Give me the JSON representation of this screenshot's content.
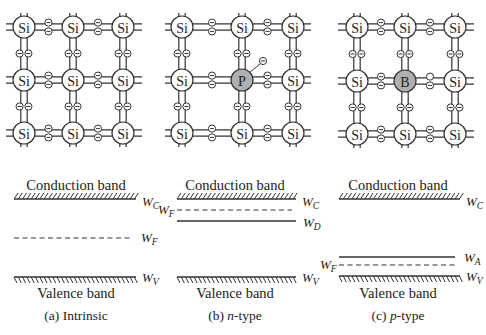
{
  "panels": [
    {
      "id": "a",
      "caption": "(a) Intrinsic",
      "dopant": null,
      "lattice_atoms": [
        [
          "Si",
          "Si",
          "Si"
        ],
        [
          "Si",
          "Si",
          "Si"
        ],
        [
          "Si",
          "Si",
          "Si"
        ]
      ],
      "conduction_label": "Conduction band",
      "valence_label": "Valence band",
      "levels": [
        {
          "name": "W",
          "sub": "C",
          "kind": "conduction"
        },
        {
          "name": "W",
          "sub": "F",
          "kind": "fermi-dashed"
        },
        {
          "name": "W",
          "sub": "V",
          "kind": "valence"
        }
      ]
    },
    {
      "id": "b",
      "caption_prefix": "(b) ",
      "caption_italic": "n",
      "caption_suffix": "-type",
      "dopant": "P",
      "free_electron": true,
      "lattice_atoms": [
        [
          "Si",
          "Si",
          "Si"
        ],
        [
          "Si",
          "P",
          "Si"
        ],
        [
          "Si",
          "Si",
          "Si"
        ]
      ],
      "conduction_label": "Conduction band",
      "valence_label": "Valence band",
      "levels": [
        {
          "name": "W",
          "sub": "C",
          "kind": "conduction"
        },
        {
          "name": "W",
          "sub": "F",
          "kind": "fermi-dashed"
        },
        {
          "name": "W",
          "sub": "D",
          "kind": "donor"
        },
        {
          "name": "W",
          "sub": "V",
          "kind": "valence"
        }
      ]
    },
    {
      "id": "c",
      "caption_prefix": "(c) ",
      "caption_italic": "p",
      "caption_suffix": "-type",
      "dopant": "B",
      "hole": true,
      "lattice_atoms": [
        [
          "Si",
          "Si",
          "Si"
        ],
        [
          "Si",
          "B",
          "Si"
        ],
        [
          "Si",
          "Si",
          "Si"
        ]
      ],
      "conduction_label": "Conduction band",
      "valence_label": "Valence band",
      "levels": [
        {
          "name": "W",
          "sub": "C",
          "kind": "conduction"
        },
        {
          "name": "W",
          "sub": "A",
          "kind": "acceptor"
        },
        {
          "name": "W",
          "sub": "F",
          "kind": "fermi-dashed"
        },
        {
          "name": "W",
          "sub": "V",
          "kind": "valence"
        }
      ]
    }
  ],
  "colors": {
    "line": "#333333",
    "dopant_fill": "#b0b0b0",
    "atom_fill": "#ffffff"
  }
}
